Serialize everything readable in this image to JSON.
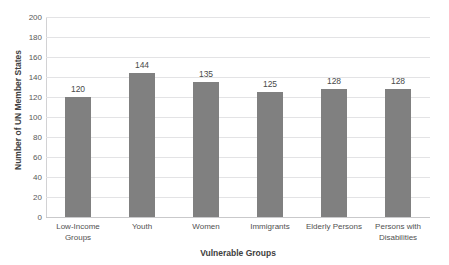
{
  "chart_data": {
    "type": "bar",
    "title": "",
    "subtitle": "",
    "xlabel": "Vulnerable Groups",
    "ylabel": "Number of UN Member States",
    "categories": [
      "Low-Income Groups",
      "Youth",
      "Women",
      "Immigrants",
      "Elderly Persons",
      "Persons with Disabilities"
    ],
    "values": [
      120,
      144,
      135,
      125,
      128,
      128
    ],
    "data_labels": [
      "120",
      "144",
      "135",
      "125",
      "128",
      "128"
    ],
    "ylim": [
      0,
      200
    ],
    "y_ticks": [
      0,
      20,
      40,
      60,
      80,
      100,
      120,
      140,
      160,
      180,
      200
    ],
    "y_tick_labels": [
      "0",
      "20",
      "40",
      "60",
      "80",
      "100",
      "120",
      "140",
      "160",
      "180",
      "200"
    ],
    "grid": true,
    "grid_axis": "y",
    "legend": false,
    "legend_position": "none",
    "bar_color": "#808080",
    "gridline_color": "#E3E3E5",
    "axis_line_color": "#C9C9CB",
    "text_color": "#515151",
    "background_color": "#FFFFFF"
  }
}
